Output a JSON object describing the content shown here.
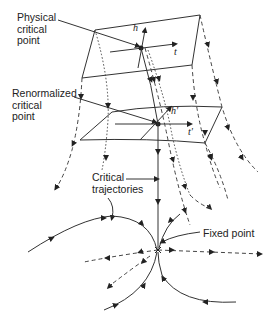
{
  "figure": {
    "labels": {
      "physical_critical_point": "Physical\ncritical\npoint",
      "renormalized_critical_point": "Renormalized\ncritical\npoint",
      "critical_trajectories": "Critical\ntrajectories",
      "fixed_point": "Fixed point"
    },
    "symbols": {
      "h": "h",
      "t": "t",
      "h_prime": "h'",
      "t_prime": "t'"
    },
    "colors": {
      "line": "#333333",
      "background": "#ffffff"
    }
  }
}
